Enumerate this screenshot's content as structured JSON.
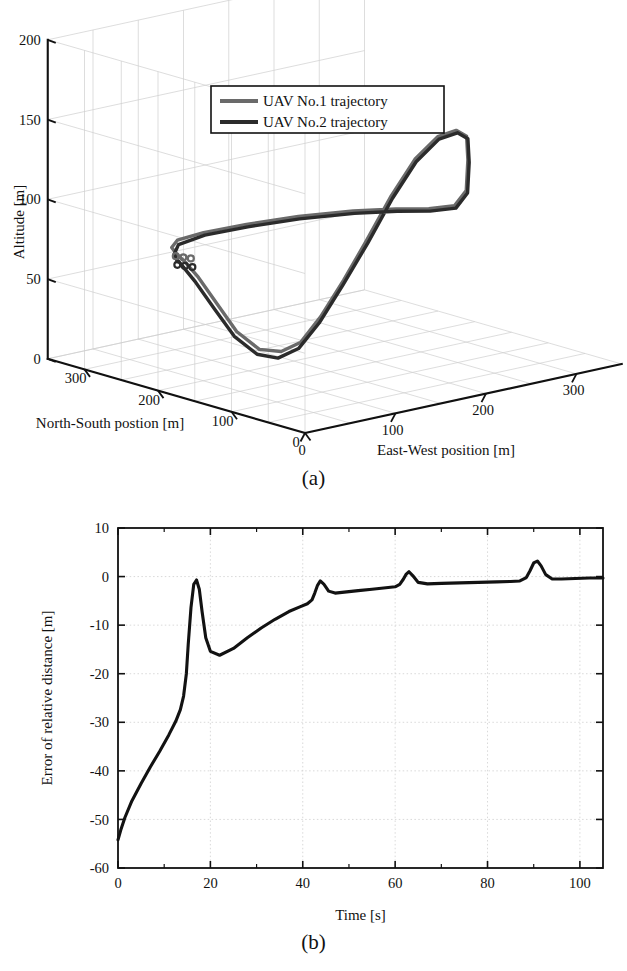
{
  "figure": {
    "panels": [
      {
        "id": "a",
        "caption": "(a)"
      },
      {
        "id": "b",
        "caption": "(b)"
      }
    ]
  },
  "colors": {
    "uav1": "#6a6a6a",
    "uav2": "#2b2b2b",
    "axis": "#111111",
    "grid": "#cfcfcf",
    "background": "#ffffff",
    "curve": "#121212"
  },
  "chart_data": [
    {
      "type": "line",
      "id": "uav-trajectory-3d",
      "projection": "3d",
      "title": "",
      "xlabel": "East-West position [m]",
      "ylabel": "North-South postion [m]",
      "zlabel": "Altitude [m]",
      "xlim": [
        0,
        350
      ],
      "ylim": [
        0,
        350
      ],
      "zlim": [
        0,
        200
      ],
      "xticks": [
        0,
        100,
        200,
        300
      ],
      "yticks": [
        0,
        100,
        200,
        300
      ],
      "zticks": [
        0,
        50,
        100,
        150,
        200
      ],
      "grid": true,
      "legend_position": "top-center",
      "legend": [
        "UAV No.1 trajectory",
        "UAV No.2 trajectory"
      ],
      "series": [
        {
          "name": "UAV No.1 trajectory",
          "color": "#6a6a6a",
          "points": [
            [
              40,
              225,
              78
            ],
            [
              46,
              238,
              79
            ],
            [
              62,
              250,
              80
            ],
            [
              95,
              255,
              80
            ],
            [
              140,
              252,
              80
            ],
            [
              190,
              243,
              80
            ],
            [
              240,
              230,
              79
            ],
            [
              275,
              215,
              78
            ],
            [
              296,
              196,
              78
            ],
            [
              305,
              172,
              82
            ],
            [
              300,
              150,
              95
            ],
            [
              288,
              133,
              118
            ],
            [
              276,
              120,
              136
            ],
            [
              258,
              112,
              143
            ],
            [
              236,
              110,
              142
            ],
            [
              214,
              114,
              130
            ],
            [
              196,
              124,
              108
            ],
            [
              180,
              138,
              80
            ],
            [
              166,
              152,
              55
            ],
            [
              152,
              166,
              32
            ],
            [
              140,
              178,
              16
            ],
            [
              128,
              190,
              10
            ],
            [
              112,
              200,
              12
            ],
            [
              95,
              210,
              24
            ],
            [
              80,
              218,
              42
            ],
            [
              64,
              224,
              60
            ],
            [
              50,
              227,
              72
            ],
            [
              42,
              227,
              77
            ],
            [
              40,
              225,
              78
            ]
          ]
        },
        {
          "name": "UAV No.2 trajectory",
          "color": "#2b2b2b",
          "points": [
            [
              36,
              218,
              74
            ],
            [
              44,
              232,
              76
            ],
            [
              60,
              246,
              78
            ],
            [
              94,
              252,
              79
            ],
            [
              139,
              249,
              79
            ],
            [
              189,
              240,
              79
            ],
            [
              239,
              227,
              78
            ],
            [
              274,
              212,
              77
            ],
            [
              295,
              193,
              77
            ],
            [
              304,
              169,
              81
            ],
            [
              299,
              147,
              94
            ],
            [
              287,
              130,
              117
            ],
            [
              275,
              117,
              135
            ],
            [
              257,
              109,
              142
            ],
            [
              235,
              107,
              141
            ],
            [
              213,
              111,
              129
            ],
            [
              195,
              121,
              107
            ],
            [
              179,
              135,
              79
            ],
            [
              163,
              149,
              53
            ],
            [
              148,
              163,
              29
            ],
            [
              135,
              175,
              13
            ],
            [
              122,
              187,
              7
            ],
            [
              107,
              197,
              10
            ],
            [
              90,
              207,
              22
            ],
            [
              74,
              214,
              40
            ],
            [
              58,
              220,
              58
            ],
            [
              44,
              221,
              70
            ],
            [
              38,
              219,
              74
            ],
            [
              36,
              218,
              74
            ]
          ]
        }
      ],
      "start_markers": [
        {
          "series": "UAV No.1 trajectory",
          "point": [
            40,
            225,
            78
          ]
        },
        {
          "series": "UAV No.2 trajectory",
          "point": [
            36,
            218,
            74
          ]
        }
      ]
    },
    {
      "type": "line",
      "id": "relative-distance-error",
      "title": "",
      "xlabel": "Time [s]",
      "ylabel": "Error of relative distance [m]",
      "xlim": [
        0,
        105
      ],
      "ylim": [
        -60,
        10
      ],
      "xticks": [
        0,
        20,
        40,
        60,
        80,
        100
      ],
      "xminorticks": [
        10,
        30,
        50,
        70,
        90
      ],
      "yticks": [
        10,
        0,
        -10,
        -20,
        -30,
        -40,
        -50,
        -60
      ],
      "grid": true,
      "legend_position": "none",
      "series": [
        {
          "name": "Error of relative distance",
          "color": "#121212",
          "x": [
            0,
            0.6,
            1.5,
            3,
            5,
            7,
            9,
            11,
            12.5,
            13.5,
            14.2,
            14.8,
            15.2,
            15.8,
            16.4,
            17,
            17.6,
            18.2,
            19,
            20,
            22,
            25,
            28,
            31,
            34,
            37,
            39.5,
            41,
            42,
            42.6,
            43.2,
            43.8,
            44.6,
            45.6,
            47,
            49,
            52,
            55,
            58,
            60,
            61,
            61.8,
            62.4,
            63,
            63.8,
            65,
            67,
            70,
            74,
            78,
            82,
            85,
            87,
            88.4,
            89.2,
            90,
            90.8,
            91.6,
            92.6,
            94,
            96,
            99,
            102,
            105
          ],
          "y": [
            -54.2,
            -52.2,
            -49.6,
            -46.2,
            -42.6,
            -39.2,
            -36.0,
            -32.6,
            -29.8,
            -27.4,
            -24.6,
            -20.0,
            -14.0,
            -6.4,
            -1.6,
            -0.7,
            -2.6,
            -7.2,
            -12.6,
            -15.4,
            -16.2,
            -14.8,
            -12.6,
            -10.6,
            -8.8,
            -7.2,
            -6.2,
            -5.6,
            -4.8,
            -3.4,
            -1.8,
            -0.9,
            -1.6,
            -3.0,
            -3.4,
            -3.2,
            -2.9,
            -2.6,
            -2.3,
            -2.1,
            -1.6,
            -0.5,
            0.5,
            1.0,
            0.2,
            -1.2,
            -1.5,
            -1.4,
            -1.3,
            -1.2,
            -1.1,
            -1.0,
            -0.9,
            -0.2,
            1.2,
            2.8,
            3.2,
            2.2,
            0.4,
            -0.5,
            -0.5,
            -0.4,
            -0.3,
            -0.3
          ]
        }
      ]
    }
  ]
}
